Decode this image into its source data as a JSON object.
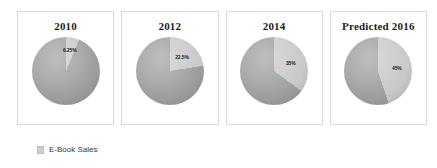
{
  "legend": {
    "swatch_color": "#cfcfcf",
    "label": "E-Book Sales"
  },
  "colors": {
    "slice_ebook": "#c9c9c9",
    "slice_other": "#9e9e9e",
    "panel_border": "#d9d9d9",
    "title_text": "#1d1d1d",
    "label_text": "#20201f",
    "background": "#ffffff"
  },
  "panels": [
    {
      "title": "2010",
      "value_label": "6.25%"
    },
    {
      "title": "2012",
      "value_label": "22.5%"
    },
    {
      "title": "2014",
      "value_label": "35%"
    },
    {
      "title": "Predicted 2016",
      "value_label": "45%"
    }
  ],
  "chart_data": {
    "type": "pie",
    "title": "",
    "legend": [
      "E-Book Sales"
    ],
    "legend_position": "bottom-left",
    "series_name": "E-Book Sales",
    "categories": [
      "2010",
      "2012",
      "2014",
      "Predicted 2016"
    ],
    "charts": [
      {
        "title": "2010",
        "slices": [
          {
            "name": "E-Book Sales",
            "value": 6.25,
            "label": "6.25%",
            "color": "#c9c9c9"
          },
          {
            "name": "Other",
            "value": 93.75,
            "label": "",
            "color": "#9e9e9e"
          }
        ]
      },
      {
        "title": "2012",
        "slices": [
          {
            "name": "E-Book Sales",
            "value": 22.5,
            "label": "22.5%",
            "color": "#c9c9c9"
          },
          {
            "name": "Other",
            "value": 77.5,
            "label": "",
            "color": "#9e9e9e"
          }
        ]
      },
      {
        "title": "2014",
        "slices": [
          {
            "name": "E-Book Sales",
            "value": 35,
            "label": "35%",
            "color": "#c9c9c9"
          },
          {
            "name": "Other",
            "value": 65,
            "label": "",
            "color": "#9e9e9e"
          }
        ]
      },
      {
        "title": "Predicted 2016",
        "slices": [
          {
            "name": "E-Book Sales",
            "value": 45,
            "label": "45%",
            "color": "#c9c9c9"
          },
          {
            "name": "Other",
            "value": 55,
            "label": "",
            "color": "#9e9e9e"
          }
        ]
      }
    ]
  }
}
